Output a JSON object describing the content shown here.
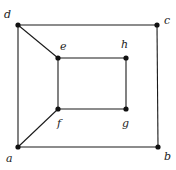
{
  "diagram": {
    "type": "graph",
    "vertices": [
      {
        "id": "a",
        "label": "a",
        "x": 18,
        "y": 147,
        "lx": 6,
        "ly": 162
      },
      {
        "id": "b",
        "label": "b",
        "x": 158,
        "y": 147,
        "lx": 164,
        "ly": 160
      },
      {
        "id": "c",
        "label": "c",
        "x": 157,
        "y": 25,
        "lx": 164,
        "ly": 24
      },
      {
        "id": "d",
        "label": "d",
        "x": 18,
        "y": 25,
        "lx": 4,
        "ly": 18
      },
      {
        "id": "e",
        "label": "e",
        "x": 58,
        "y": 58,
        "lx": 60,
        "ly": 50
      },
      {
        "id": "f",
        "label": "f",
        "x": 58,
        "y": 109,
        "lx": 57,
        "ly": 127
      },
      {
        "id": "g",
        "label": "g",
        "x": 126,
        "y": 109,
        "lx": 122,
        "ly": 127
      },
      {
        "id": "h",
        "label": "h",
        "x": 126,
        "y": 58,
        "lx": 121,
        "ly": 48
      }
    ],
    "edges": [
      [
        "a",
        "b"
      ],
      [
        "b",
        "c"
      ],
      [
        "c",
        "d"
      ],
      [
        "d",
        "a"
      ],
      [
        "e",
        "h"
      ],
      [
        "h",
        "g"
      ],
      [
        "g",
        "f"
      ],
      [
        "f",
        "e"
      ],
      [
        "d",
        "e"
      ],
      [
        "a",
        "f"
      ]
    ]
  }
}
